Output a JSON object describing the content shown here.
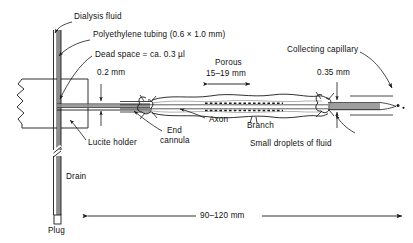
{
  "figure": {
    "type": "line-diagram",
    "background_color": "#ffffff",
    "line_color": "#1a1a1a",
    "fill_gray": "#8d8d8d"
  },
  "labels": {
    "dialysis_fluid": "Dialysis fluid",
    "polyethylene_tubing": "Polyethylene tubing (0.6 × 1.0 mm)",
    "dead_space": "Dead space = ca. 0.3 µl",
    "dim_0_2mm": "0.2 mm",
    "porous_line1": "Porous",
    "porous_line2": "15–19 mm",
    "collecting_capillary": "Collecting capillary",
    "dim_0_35mm": "0.35 mm",
    "lucite_holder": "Lucite holder",
    "end_cannula_line1": "End",
    "end_cannula_line2": "cannula",
    "axon": "Axon",
    "branch": "Branch",
    "small_droplets": "Small droplets of fluid",
    "drain": "Drain",
    "plug": "Plug",
    "overall_length": "90–120 mm"
  },
  "dimensions": {
    "dead_space_volume": "0.3 µl",
    "tubing_id_mm": 0.6,
    "tubing_od_mm": 1.0,
    "gap_mm": 0.2,
    "capillary_mm": 0.35,
    "porous_length_mm": "15–19",
    "overall_length_mm": "90–120"
  }
}
